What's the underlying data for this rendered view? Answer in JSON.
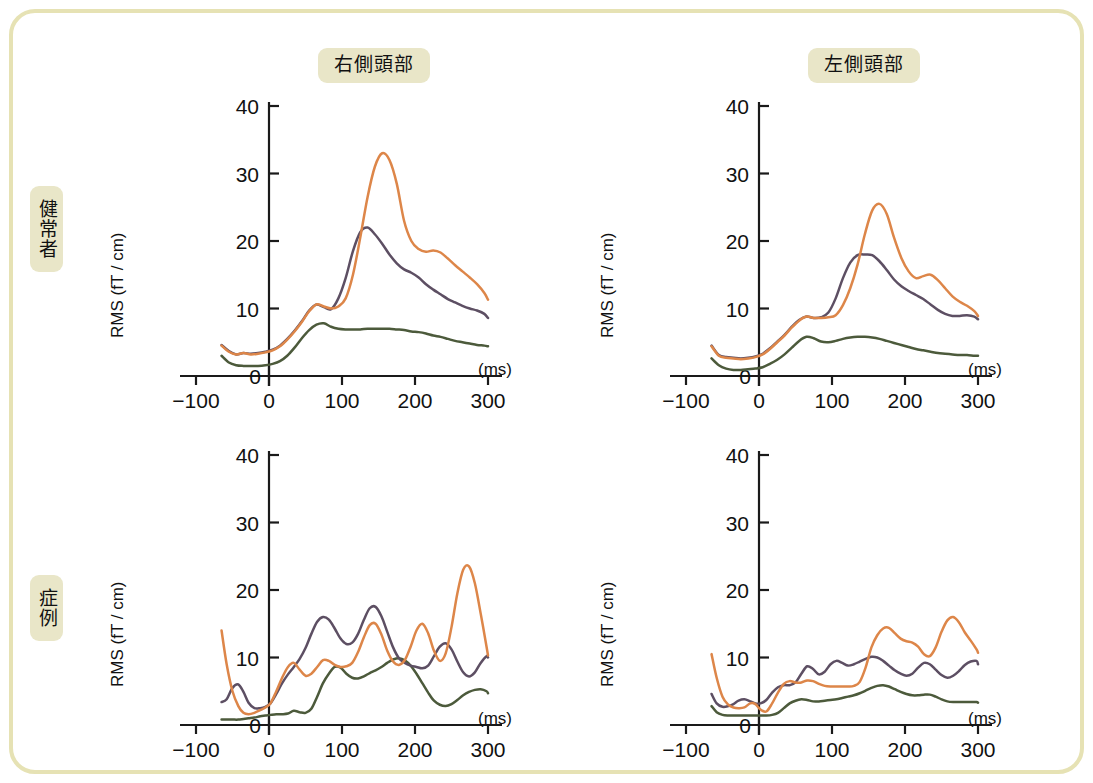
{
  "figure": {
    "border_color": "#E6E2B4",
    "background": "#FFFFFF",
    "row_labels": [
      {
        "id": "healthy",
        "text": "健常者"
      },
      {
        "id": "case",
        "text": "症例"
      }
    ],
    "column_labels": [
      {
        "id": "right-temporal",
        "text": "右側頭部"
      },
      {
        "id": "left-temporal",
        "text": "左側頭部"
      }
    ]
  },
  "axes": {
    "ylabel": "RMS (fT / cm)",
    "xunit": "(ms)",
    "xticks": [
      "−100",
      "0",
      "100",
      "200",
      "300"
    ],
    "xtick_values": [
      -100,
      0,
      100,
      200,
      300
    ],
    "yticks": [
      "0",
      "10",
      "20",
      "30",
      "40"
    ],
    "ytick_values": [
      0,
      10,
      20,
      30,
      40
    ],
    "xlim": [
      -100,
      300
    ],
    "ylim": [
      0,
      40
    ],
    "data_start_ms": -65
  },
  "colors": {
    "orange": "#DD8649",
    "purple": "#5D4F63",
    "green": "#4C5A3B"
  },
  "chart_data": [
    {
      "id": "healthy-right-temporal",
      "type": "line",
      "title": "健常者 / 右側頭部",
      "xlabel": "(ms)",
      "ylabel": "RMS (fT / cm)",
      "xlim": [
        -100,
        300
      ],
      "ylim": [
        0,
        40
      ],
      "grid": false,
      "legend": "none",
      "x": [
        -65,
        -55,
        -45,
        -35,
        -25,
        -15,
        -5,
        5,
        15,
        25,
        35,
        45,
        55,
        65,
        75,
        85,
        95,
        105,
        115,
        125,
        135,
        145,
        155,
        165,
        175,
        185,
        195,
        205,
        215,
        225,
        235,
        245,
        255,
        265,
        275,
        285,
        295,
        300
      ],
      "series": [
        {
          "name": "orange",
          "color": "#DD8649",
          "values": [
            4.5,
            3.6,
            3.2,
            3.4,
            3.2,
            3.3,
            3.5,
            3.8,
            4.4,
            5.4,
            6.6,
            8.0,
            9.6,
            10.6,
            10.3,
            10.0,
            10.3,
            11.5,
            15.0,
            20.5,
            26.5,
            31.0,
            33.0,
            32.0,
            28.5,
            23.0,
            20.0,
            18.8,
            18.4,
            18.6,
            18.3,
            17.4,
            16.4,
            15.5,
            14.6,
            13.6,
            12.3,
            11.3
          ]
        },
        {
          "name": "purple",
          "color": "#5D4F63",
          "values": [
            4.6,
            3.7,
            3.2,
            3.4,
            3.3,
            3.4,
            3.6,
            3.9,
            4.5,
            5.5,
            6.7,
            8.1,
            9.7,
            10.6,
            10.2,
            9.9,
            11.5,
            14.5,
            18.5,
            21.3,
            22.0,
            21.0,
            19.6,
            18.0,
            16.7,
            15.8,
            15.3,
            14.6,
            13.6,
            12.8,
            12.1,
            11.4,
            10.9,
            10.4,
            10.0,
            9.7,
            9.2,
            8.6
          ]
        },
        {
          "name": "green",
          "color": "#4C5A3B",
          "values": [
            3.0,
            2.0,
            1.6,
            1.5,
            1.5,
            1.5,
            1.6,
            1.8,
            2.2,
            3.0,
            4.2,
            5.6,
            6.8,
            7.6,
            7.8,
            7.3,
            7.0,
            6.9,
            6.9,
            6.9,
            7.0,
            7.0,
            7.0,
            7.0,
            6.9,
            6.8,
            6.6,
            6.5,
            6.3,
            6.0,
            5.8,
            5.5,
            5.2,
            5.0,
            4.8,
            4.6,
            4.5,
            4.4
          ]
        }
      ]
    },
    {
      "id": "healthy-left-temporal",
      "type": "line",
      "title": "健常者 / 左側頭部",
      "xlabel": "(ms)",
      "ylabel": "RMS (fT / cm)",
      "xlim": [
        -100,
        300
      ],
      "ylim": [
        0,
        40
      ],
      "grid": false,
      "legend": "none",
      "x": [
        -65,
        -55,
        -45,
        -35,
        -25,
        -15,
        -5,
        5,
        15,
        25,
        35,
        45,
        55,
        65,
        75,
        85,
        95,
        105,
        115,
        125,
        135,
        145,
        155,
        165,
        175,
        185,
        195,
        205,
        215,
        225,
        235,
        245,
        255,
        265,
        275,
        285,
        295,
        300
      ],
      "series": [
        {
          "name": "orange",
          "color": "#DD8649",
          "values": [
            4.4,
            3.0,
            2.7,
            2.6,
            2.5,
            2.6,
            2.8,
            3.2,
            4.0,
            5.0,
            6.0,
            7.2,
            8.2,
            8.8,
            8.6,
            8.6,
            8.7,
            9.0,
            10.5,
            13.0,
            16.5,
            21.0,
            24.5,
            25.5,
            24.0,
            20.5,
            17.5,
            15.5,
            14.5,
            14.8,
            15.0,
            14.2,
            13.0,
            11.8,
            11.0,
            10.4,
            9.6,
            8.9
          ]
        },
        {
          "name": "purple",
          "color": "#5D4F63",
          "values": [
            4.5,
            3.1,
            2.8,
            2.7,
            2.6,
            2.7,
            2.9,
            3.3,
            4.1,
            5.1,
            6.1,
            7.3,
            8.3,
            8.8,
            8.6,
            8.7,
            9.4,
            11.5,
            14.5,
            16.8,
            17.9,
            18.0,
            17.9,
            17.0,
            15.7,
            14.3,
            13.3,
            12.6,
            12.0,
            11.4,
            10.6,
            9.8,
            9.2,
            8.9,
            8.9,
            9.0,
            8.8,
            8.4
          ]
        },
        {
          "name": "green",
          "color": "#4C5A3B",
          "values": [
            2.6,
            1.6,
            1.1,
            0.9,
            0.9,
            1.0,
            1.1,
            1.3,
            1.8,
            2.4,
            3.2,
            4.2,
            5.2,
            5.8,
            5.6,
            5.1,
            5.0,
            5.2,
            5.5,
            5.7,
            5.8,
            5.8,
            5.7,
            5.5,
            5.2,
            4.9,
            4.6,
            4.3,
            4.0,
            3.8,
            3.6,
            3.4,
            3.3,
            3.2,
            3.1,
            3.1,
            3.0,
            3.0
          ]
        }
      ]
    },
    {
      "id": "case-right-temporal",
      "type": "line",
      "title": "症例 / 右側頭部",
      "xlabel": "(ms)",
      "ylabel": "RMS (fT / cm)",
      "xlim": [
        -100,
        300
      ],
      "ylim": [
        0,
        40
      ],
      "grid": false,
      "legend": "none",
      "x": [
        -65,
        -58,
        -50,
        -42,
        -35,
        -28,
        -20,
        -12,
        -5,
        2,
        10,
        18,
        26,
        34,
        42,
        50,
        58,
        66,
        74,
        82,
        90,
        98,
        106,
        114,
        122,
        130,
        138,
        146,
        154,
        162,
        170,
        178,
        186,
        194,
        202,
        210,
        218,
        226,
        234,
        242,
        250,
        258,
        266,
        274,
        282,
        290,
        298,
        300
      ],
      "series": [
        {
          "name": "orange",
          "color": "#DD8649",
          "values": [
            14.0,
            9.0,
            5.0,
            2.8,
            1.8,
            1.6,
            1.8,
            2.2,
            2.6,
            3.2,
            5.0,
            7.0,
            8.6,
            9.2,
            8.2,
            7.3,
            7.6,
            8.6,
            9.6,
            9.5,
            8.9,
            8.6,
            8.7,
            9.2,
            10.8,
            13.0,
            14.8,
            15.0,
            13.4,
            11.0,
            9.4,
            8.9,
            9.6,
            11.6,
            14.0,
            15.0,
            13.6,
            11.0,
            9.5,
            10.6,
            14.5,
            19.5,
            23.0,
            23.5,
            21.0,
            16.5,
            11.6,
            10.3
          ]
        },
        {
          "name": "purple",
          "color": "#5D4F63",
          "values": [
            3.4,
            3.8,
            5.5,
            6.0,
            4.9,
            3.3,
            2.5,
            2.5,
            2.7,
            3.2,
            4.6,
            6.2,
            7.5,
            8.6,
            9.8,
            11.4,
            13.5,
            15.3,
            16.0,
            15.6,
            14.3,
            12.8,
            12.0,
            12.2,
            13.5,
            15.6,
            17.3,
            17.5,
            16.1,
            13.8,
            11.5,
            9.9,
            9.2,
            8.8,
            8.6,
            8.4,
            8.8,
            10.2,
            11.6,
            12.1,
            11.2,
            9.4,
            7.8,
            7.2,
            7.8,
            9.2,
            10.2,
            10.0
          ]
        },
        {
          "name": "green",
          "color": "#4C5A3B",
          "values": [
            0.8,
            0.8,
            0.8,
            0.8,
            0.9,
            1.0,
            1.1,
            1.3,
            1.4,
            1.5,
            1.6,
            1.6,
            1.7,
            2.1,
            1.9,
            1.8,
            2.4,
            4.2,
            6.2,
            7.6,
            8.6,
            8.5,
            7.6,
            7.0,
            6.9,
            7.2,
            7.7,
            8.1,
            8.6,
            9.2,
            9.7,
            9.9,
            9.6,
            8.8,
            7.6,
            6.2,
            4.8,
            3.6,
            3.0,
            2.8,
            3.1,
            3.7,
            4.4,
            4.9,
            5.2,
            5.3,
            5.0,
            4.7
          ]
        }
      ]
    },
    {
      "id": "case-left-temporal",
      "type": "line",
      "title": "症例 / 左側頭部",
      "xlabel": "(ms)",
      "ylabel": "RMS (fT / cm)",
      "xlim": [
        -100,
        300
      ],
      "ylim": [
        0,
        40
      ],
      "grid": false,
      "legend": "none",
      "x": [
        -65,
        -58,
        -50,
        -42,
        -35,
        -28,
        -20,
        -12,
        -5,
        2,
        10,
        18,
        26,
        34,
        42,
        50,
        58,
        66,
        74,
        82,
        90,
        98,
        106,
        114,
        122,
        130,
        138,
        146,
        154,
        162,
        170,
        178,
        186,
        194,
        202,
        210,
        218,
        226,
        234,
        242,
        250,
        258,
        266,
        274,
        282,
        290,
        298,
        300
      ],
      "series": [
        {
          "name": "orange",
          "color": "#DD8649",
          "values": [
            10.5,
            7.0,
            4.2,
            3.0,
            2.6,
            2.5,
            2.6,
            3.2,
            3.1,
            2.3,
            2.0,
            3.2,
            4.8,
            6.1,
            6.5,
            6.3,
            6.3,
            6.6,
            6.5,
            6.1,
            5.8,
            5.7,
            5.7,
            5.7,
            5.7,
            5.8,
            6.4,
            8.5,
            11.5,
            13.3,
            14.3,
            14.4,
            13.6,
            12.8,
            12.4,
            12.2,
            11.6,
            10.5,
            10.2,
            11.5,
            13.8,
            15.5,
            16.0,
            15.2,
            13.7,
            12.5,
            11.2,
            10.7
          ]
        },
        {
          "name": "purple",
          "color": "#5D4F63",
          "values": [
            4.6,
            3.2,
            2.7,
            2.8,
            3.1,
            3.6,
            3.8,
            3.5,
            3.2,
            3.2,
            3.7,
            4.8,
            5.6,
            5.9,
            5.9,
            6.3,
            7.6,
            8.7,
            8.3,
            7.5,
            7.9,
            9.0,
            9.5,
            9.2,
            8.8,
            9.0,
            9.4,
            9.8,
            10.1,
            10.0,
            9.5,
            8.8,
            8.1,
            7.6,
            7.3,
            7.6,
            8.5,
            9.2,
            9.0,
            8.2,
            7.4,
            7.0,
            7.3,
            8.0,
            8.9,
            9.4,
            9.5,
            9.0
          ]
        },
        {
          "name": "green",
          "color": "#4C5A3B",
          "values": [
            2.8,
            1.9,
            1.5,
            1.4,
            1.4,
            1.4,
            1.4,
            1.4,
            1.4,
            1.4,
            1.4,
            1.5,
            1.8,
            2.5,
            3.2,
            3.6,
            3.8,
            3.7,
            3.5,
            3.5,
            3.6,
            3.7,
            3.8,
            4.0,
            4.2,
            4.4,
            4.7,
            5.1,
            5.5,
            5.8,
            5.9,
            5.7,
            5.3,
            4.9,
            4.6,
            4.4,
            4.4,
            4.5,
            4.5,
            4.2,
            3.8,
            3.5,
            3.4,
            3.4,
            3.4,
            3.4,
            3.4,
            3.3
          ]
        }
      ]
    }
  ]
}
